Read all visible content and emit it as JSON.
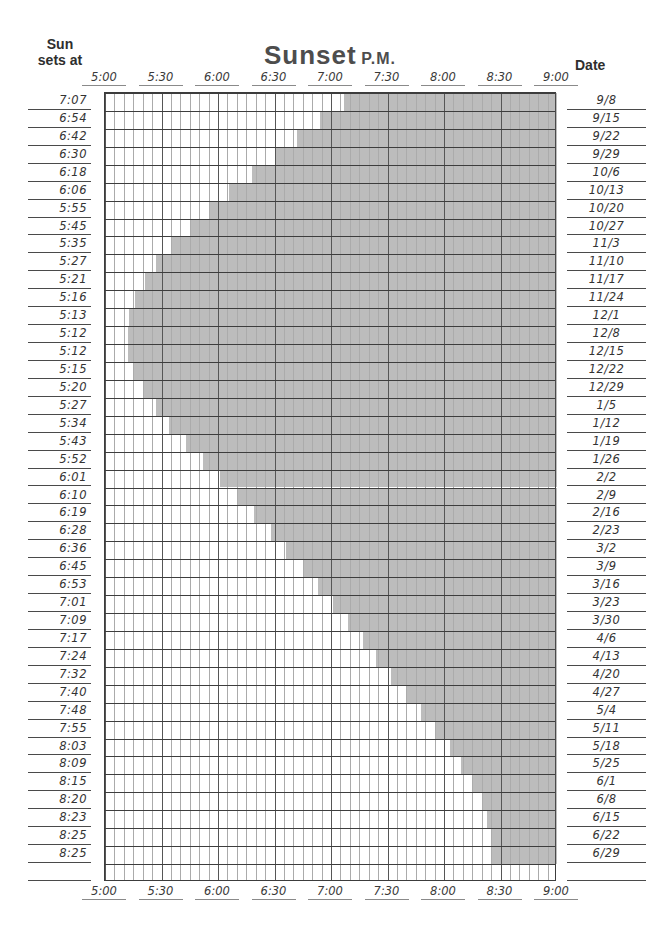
{
  "header": {
    "left_line1": "Sun",
    "left_line2": "sets at",
    "title": "Sunset",
    "title_suffix": "P.M.",
    "right_label": "Date"
  },
  "chart_data": {
    "type": "area",
    "title": "Sunset P.M.",
    "x_axis": {
      "tick_labels": [
        "5:00",
        "5:30",
        "6:00",
        "6:30",
        "7:00",
        "7:30",
        "8:00",
        "8:30",
        "9:00"
      ],
      "range_minutes": [
        0,
        240
      ],
      "origin_time": "5:00 PM",
      "end_time": "9:00 PM",
      "minor_step_minutes": 5,
      "major_step_minutes": 30,
      "labels_shown": "top and bottom"
    },
    "left_column_header": "Sun sets at",
    "right_column_header": "Date",
    "rows": [
      {
        "sunset": "7:07",
        "date": "9/8"
      },
      {
        "sunset": "6:54",
        "date": "9/15"
      },
      {
        "sunset": "6:42",
        "date": "9/22"
      },
      {
        "sunset": "6:30",
        "date": "9/29"
      },
      {
        "sunset": "6:18",
        "date": "10/6"
      },
      {
        "sunset": "6:06",
        "date": "10/13"
      },
      {
        "sunset": "5:55",
        "date": "10/20"
      },
      {
        "sunset": "5:45",
        "date": "10/27"
      },
      {
        "sunset": "5:35",
        "date": "11/3"
      },
      {
        "sunset": "5:27",
        "date": "11/10"
      },
      {
        "sunset": "5:21",
        "date": "11/17"
      },
      {
        "sunset": "5:16",
        "date": "11/24"
      },
      {
        "sunset": "5:13",
        "date": "12/1"
      },
      {
        "sunset": "5:12",
        "date": "12/8"
      },
      {
        "sunset": "5:12",
        "date": "12/15"
      },
      {
        "sunset": "5:15",
        "date": "12/22"
      },
      {
        "sunset": "5:20",
        "date": "12/29"
      },
      {
        "sunset": "5:27",
        "date": "1/5"
      },
      {
        "sunset": "5:34",
        "date": "1/12"
      },
      {
        "sunset": "5:43",
        "date": "1/19"
      },
      {
        "sunset": "5:52",
        "date": "1/26"
      },
      {
        "sunset": "6:01",
        "date": "2/2"
      },
      {
        "sunset": "6:10",
        "date": "2/9"
      },
      {
        "sunset": "6:19",
        "date": "2/16"
      },
      {
        "sunset": "6:28",
        "date": "2/23"
      },
      {
        "sunset": "6:36",
        "date": "3/2"
      },
      {
        "sunset": "6:45",
        "date": "3/9"
      },
      {
        "sunset": "6:53",
        "date": "3/16"
      },
      {
        "sunset": "7:01",
        "date": "3/23"
      },
      {
        "sunset": "7:09",
        "date": "3/30"
      },
      {
        "sunset": "7:17",
        "date": "4/6"
      },
      {
        "sunset": "7:24",
        "date": "4/13"
      },
      {
        "sunset": "7:32",
        "date": "4/20"
      },
      {
        "sunset": "7:40",
        "date": "4/27"
      },
      {
        "sunset": "7:48",
        "date": "5/4"
      },
      {
        "sunset": "7:55",
        "date": "5/11"
      },
      {
        "sunset": "8:03",
        "date": "5/18"
      },
      {
        "sunset": "8:09",
        "date": "5/25"
      },
      {
        "sunset": "8:15",
        "date": "6/1"
      },
      {
        "sunset": "8:20",
        "date": "6/8"
      },
      {
        "sunset": "8:23",
        "date": "6/15"
      },
      {
        "sunset": "8:25",
        "date": "6/22"
      },
      {
        "sunset": "8:25",
        "date": "6/29"
      }
    ],
    "blank_trailing_rows": 1,
    "shading_rule": "shaded region spans from sunset time to 9:00 PM in each weekly row",
    "colors": {
      "shade_effective": "#bdbdbd",
      "grid_minor_line": "#ababab",
      "grid_major_line": "#565656",
      "row_line": "#3d3d3d",
      "text": "#333333",
      "title": "#4d4d4d"
    },
    "grid_on": true
  }
}
